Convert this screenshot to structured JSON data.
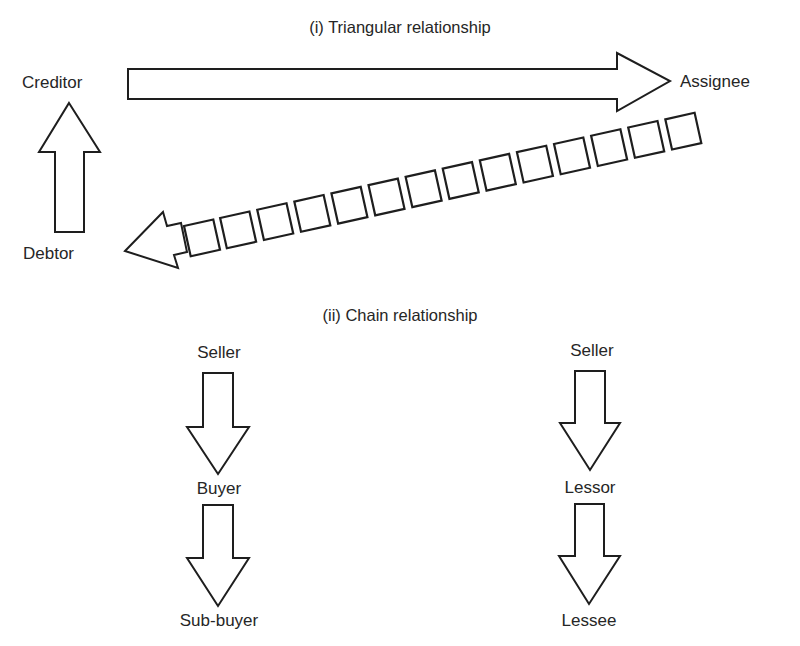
{
  "diagram": {
    "colors": {
      "background": "#ffffff",
      "stroke": "#1e1e1e",
      "text": "#262626"
    },
    "triangular": {
      "heading": "(i) Triangular relationship",
      "nodes": {
        "creditor": "Creditor",
        "assignee": "Assignee",
        "debtor": "Debtor"
      },
      "edges": [
        {
          "from": "Creditor",
          "to": "Assignee",
          "style": "solid-block-arrow"
        },
        {
          "from": "Debtor",
          "to": "Creditor",
          "style": "solid-block-arrow"
        },
        {
          "from": "Assignee",
          "to": "Debtor",
          "style": "dashed-box-arrow",
          "segments": 14
        }
      ]
    },
    "chain": {
      "heading": "(ii) Chain relationship",
      "columns": [
        {
          "nodes": [
            "Seller",
            "Buyer",
            "Sub-buyer"
          ],
          "edges": [
            {
              "from": "Seller",
              "to": "Buyer",
              "style": "solid-block-arrow"
            },
            {
              "from": "Buyer",
              "to": "Sub-buyer",
              "style": "solid-block-arrow"
            }
          ]
        },
        {
          "nodes": [
            "Seller",
            "Lessor",
            "Lessee"
          ],
          "edges": [
            {
              "from": "Seller",
              "to": "Lessor",
              "style": "solid-block-arrow"
            },
            {
              "from": "Lessor",
              "to": "Lessee",
              "style": "solid-block-arrow"
            }
          ]
        }
      ]
    }
  }
}
